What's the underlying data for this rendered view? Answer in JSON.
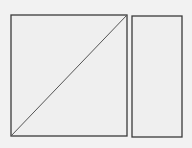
{
  "diagram": {
    "background": "#f2f2f2",
    "stroke": "#3a3a3a",
    "fill": "#efefef",
    "shapes": [
      {
        "id": "left-square",
        "type": "rect",
        "x": 11,
        "y": 15,
        "width": 116,
        "height": 121
      },
      {
        "id": "diagonal",
        "type": "line",
        "x1": 11,
        "y1": 136,
        "x2": 127,
        "y2": 15
      },
      {
        "id": "right-rect",
        "type": "rect",
        "x": 132,
        "y": 16,
        "width": 50,
        "height": 121
      }
    ]
  }
}
